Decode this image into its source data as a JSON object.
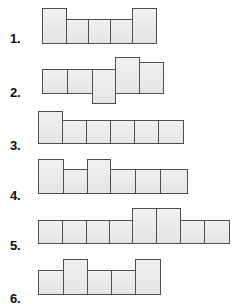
{
  "sheet": {
    "title": "Block Figures Worksheet",
    "background_color": "#ffffff",
    "cell_fill_color": "#e9e9e9",
    "cell_border_color": "#4f4f4f",
    "label_color": "#0d0d0d"
  },
  "rows": [
    {
      "label": "1.",
      "label_x": 10,
      "label_y": 32,
      "group_x": 42,
      "group_y": 8,
      "cell_count": 5,
      "cells": [
        {
          "x": 0,
          "y": 0,
          "w": 25,
          "h": 36
        },
        {
          "x": 24,
          "y": 11,
          "w": 23,
          "h": 25
        },
        {
          "x": 46,
          "y": 11,
          "w": 23,
          "h": 25
        },
        {
          "x": 68,
          "y": 11,
          "w": 23,
          "h": 25
        },
        {
          "x": 90,
          "y": 0,
          "w": 25,
          "h": 36
        }
      ]
    },
    {
      "label": "2.",
      "label_x": 10,
      "label_y": 86,
      "group_x": 42,
      "group_y": 57,
      "cell_count": 5,
      "cells": [
        {
          "x": 0,
          "y": 12,
          "w": 26,
          "h": 25
        },
        {
          "x": 25,
          "y": 12,
          "w": 26,
          "h": 25
        },
        {
          "x": 50,
          "y": 12,
          "w": 24,
          "h": 35
        },
        {
          "x": 73,
          "y": 0,
          "w": 25,
          "h": 37
        },
        {
          "x": 97,
          "y": 5,
          "w": 25,
          "h": 32
        }
      ]
    },
    {
      "label": "3.",
      "label_x": 10,
      "label_y": 139,
      "group_x": 38,
      "group_y": 111,
      "cell_count": 6,
      "cells": [
        {
          "x": 0,
          "y": 0,
          "w": 25,
          "h": 33
        },
        {
          "x": 24,
          "y": 9,
          "w": 25,
          "h": 24
        },
        {
          "x": 48,
          "y": 9,
          "w": 25,
          "h": 24
        },
        {
          "x": 72,
          "y": 9,
          "w": 25,
          "h": 24
        },
        {
          "x": 96,
          "y": 9,
          "w": 25,
          "h": 24
        },
        {
          "x": 120,
          "y": 9,
          "w": 26,
          "h": 24
        }
      ]
    },
    {
      "label": "4.",
      "label_x": 10,
      "label_y": 189,
      "group_x": 38,
      "group_y": 159,
      "cell_count": 6,
      "cells": [
        {
          "x": 0,
          "y": 0,
          "w": 26,
          "h": 35
        },
        {
          "x": 25,
          "y": 10,
          "w": 25,
          "h": 25
        },
        {
          "x": 49,
          "y": 0,
          "w": 24,
          "h": 35
        },
        {
          "x": 72,
          "y": 10,
          "w": 26,
          "h": 25
        },
        {
          "x": 97,
          "y": 10,
          "w": 26,
          "h": 25
        },
        {
          "x": 122,
          "y": 10,
          "w": 28,
          "h": 25
        }
      ]
    },
    {
      "label": "5.",
      "label_x": 10,
      "label_y": 239,
      "group_x": 38,
      "group_y": 208,
      "cell_count": 8,
      "cells": [
        {
          "x": 0,
          "y": 12,
          "w": 25,
          "h": 24
        },
        {
          "x": 24,
          "y": 12,
          "w": 25,
          "h": 24
        },
        {
          "x": 48,
          "y": 12,
          "w": 24,
          "h": 24
        },
        {
          "x": 71,
          "y": 12,
          "w": 24,
          "h": 24
        },
        {
          "x": 94,
          "y": 0,
          "w": 25,
          "h": 36
        },
        {
          "x": 118,
          "y": 0,
          "w": 25,
          "h": 36
        },
        {
          "x": 142,
          "y": 12,
          "w": 25,
          "h": 24
        },
        {
          "x": 166,
          "y": 12,
          "w": 26,
          "h": 24
        }
      ]
    },
    {
      "label": "6.",
      "label_x": 10,
      "label_y": 292,
      "group_x": 38,
      "group_y": 259,
      "cell_count": 5,
      "cells": [
        {
          "x": 0,
          "y": 11,
          "w": 26,
          "h": 25
        },
        {
          "x": 25,
          "y": 0,
          "w": 25,
          "h": 36
        },
        {
          "x": 49,
          "y": 11,
          "w": 25,
          "h": 25
        },
        {
          "x": 73,
          "y": 11,
          "w": 25,
          "h": 25
        },
        {
          "x": 97,
          "y": 0,
          "w": 26,
          "h": 36
        }
      ]
    }
  ]
}
